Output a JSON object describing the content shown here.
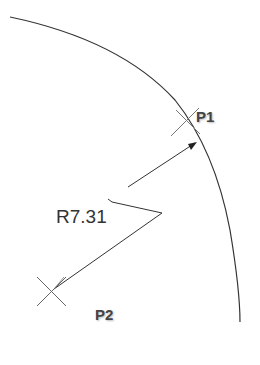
{
  "drawing": {
    "points": [
      {
        "label": "P1",
        "x": 186,
        "y": 120,
        "label_x": 196,
        "label_y": 108
      },
      {
        "label": "P2",
        "x": 51,
        "y": 290,
        "label_x": 95,
        "label_y": 306
      }
    ],
    "dimension": {
      "text": "R7.31",
      "x": 56,
      "y": 208
    },
    "colors": {
      "line": "#333333",
      "text": "#3a3a3a"
    }
  }
}
